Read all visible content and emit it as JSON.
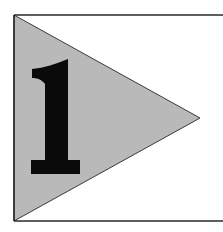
{
  "pennant": {
    "numeral": "1",
    "fill_color": "#b9b9b9",
    "numeral_color": "#0a0a0a",
    "border_color": "#2a2a2a",
    "background_color": "#ffffff"
  }
}
